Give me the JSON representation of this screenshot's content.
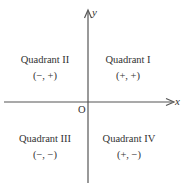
{
  "diagram": {
    "title": "",
    "axes": {
      "x_label": "x",
      "y_label": "y",
      "origin_label": "O"
    },
    "quadrants": [
      {
        "name": "Quadrant I",
        "signs": "(+, +)"
      },
      {
        "name": "Quadrant II",
        "signs": "(−, +)"
      },
      {
        "name": "Quadrant III",
        "signs": "(−, −)"
      },
      {
        "name": "Quadrant IV",
        "signs": "(+, −)"
      }
    ],
    "colors": {
      "axis": "#555555",
      "text": "#333333",
      "background": "#ffffff"
    }
  }
}
